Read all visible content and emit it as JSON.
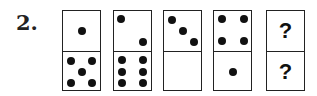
{
  "question_number": "2.",
  "pip_color": "#111111",
  "dominoes": [
    {
      "top": 1,
      "bottom": 5
    },
    {
      "top": 2,
      "bottom": 6
    },
    {
      "top": 3,
      "bottom": 0
    },
    {
      "top": 4,
      "bottom": 1
    },
    {
      "top": "?",
      "bottom": "?"
    }
  ],
  "unknown_label": "?"
}
